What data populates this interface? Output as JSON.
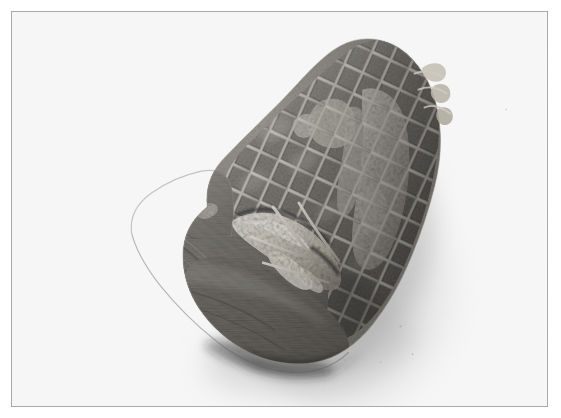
{
  "image": {
    "kind": "photograph",
    "color_mode": "black-and-white",
    "subject": "netted rolled meat roast",
    "alt_text": "Black and white photograph of a rolled joint of meat tied in an elastic netting, resting on a plain white surface with a soft shadow to the lower right.",
    "width_px": 561,
    "height_px": 418
  },
  "frame": {
    "border_color": "#a9a9ad",
    "border_width_px": 1,
    "inset_left_px": 11,
    "inset_top_px": 11,
    "frame_width_px": 537,
    "frame_height_px": 396,
    "background_color": "#fefefe"
  },
  "palette": {
    "page_background": "#ffffff",
    "photo_background": "#fefefe",
    "shadow_light": "#e4e4e4",
    "shadow_mid": "#c9c9c9",
    "shadow_dark": "#9d9d9d",
    "meat_highlight": "#c9c5bd",
    "meat_mid": "#8e8a84",
    "meat_dark": "#5c5a57",
    "meat_deep_shadow": "#3a3937",
    "netting_light": "#d9d6cd",
    "netting_shade": "#a39f96",
    "fat_light": "#e6e2d8",
    "fat_mid": "#cbc6ba"
  },
  "subject_geometry": {
    "description": "Barrel-shaped roast seen from a three-quarter angle; flat cut face on the lower left, netted dome rising to the upper right.",
    "bounds": {
      "x": 118,
      "y": 38,
      "width": 330,
      "height": 332
    },
    "netting": {
      "pattern": "diamond lattice",
      "strand_count_major": 11,
      "strand_count_minor": 12,
      "strand_color": "#d9d6cd"
    },
    "shadow": {
      "direction": "lower-right",
      "opacity": 0.42,
      "blur_px": 16
    }
  },
  "regions": [
    {
      "name": "netted-dome",
      "note": "upper-right domed surface wrapped in netting"
    },
    {
      "name": "cut-face",
      "note": "flat lower-left end of the roll, unnetted, fibrous texture"
    },
    {
      "name": "fat-cleft",
      "note": "bright pale fat and stuffing bulging from the seam at centre"
    },
    {
      "name": "fat-band-right",
      "note": "pale strip of fat running down the right flank"
    },
    {
      "name": "net-tail",
      "note": "small tufts of netting and fat protruding at the upper right edge"
    },
    {
      "name": "cast-shadow",
      "note": "soft grey shadow to the lower right of the joint"
    }
  ],
  "text_content": {
    "visible_text": "",
    "has_caption": false,
    "has_watermark": false
  }
}
